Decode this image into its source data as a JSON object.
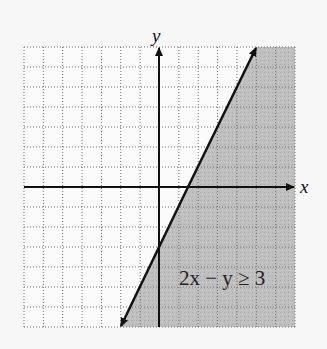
{
  "chart_data": {
    "type": "inequality-graph",
    "title": "",
    "inequality_label": "2x − y ≥ 3",
    "boundary_line": {
      "equation": "2x - y = 3",
      "slope": 2,
      "y_intercept": -3,
      "x_intercept": 1.5,
      "style": "solid"
    },
    "shaded_region": "right / below the line (2x - y ≥ 3)",
    "xlabel": "x",
    "ylabel": "y",
    "xlim": [
      -7,
      7
    ],
    "ylim": [
      -7,
      7
    ],
    "grid": true,
    "grid_style": "dotted",
    "grid_step": 1,
    "colors": {
      "shade": "#bdbdbd",
      "grid": "#777777",
      "axis": "#111111",
      "background": "#f7f7f7"
    }
  },
  "labels": {
    "x_axis": "x",
    "y_axis": "y",
    "inequality": "2x − y ≥ 3"
  }
}
